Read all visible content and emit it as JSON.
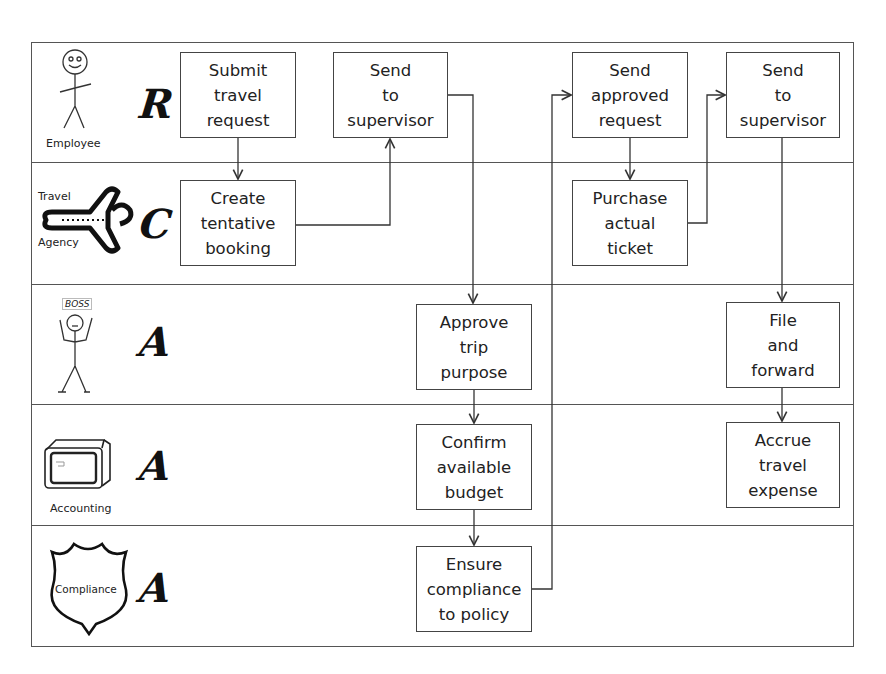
{
  "diagram": {
    "type": "RACI swimlane flowchart",
    "lanes": [
      {
        "actor": "Employee",
        "raci": "R",
        "icon": "stick-figure-icon"
      },
      {
        "actor": "Travel Agency",
        "actor_line1": "Travel",
        "actor_line2": "Agency",
        "raci": "C",
        "icon": "airplane-icon"
      },
      {
        "actor": "Boss",
        "badge": "BOSS",
        "raci": "A",
        "icon": "boss-stick-figure-icon"
      },
      {
        "actor": "Accounting",
        "raci": "A",
        "icon": "computer-monitor-icon"
      },
      {
        "actor": "Compliance",
        "raci": "A",
        "icon": "shield-icon"
      }
    ],
    "steps": {
      "submit": "Submit\ntravel\nrequest",
      "create": "Create\ntentative\nbooking",
      "send1": "Send\nto\nsupervisor",
      "approve": "Approve\ntrip\npurpose",
      "confirm": "Confirm\navailable\nbudget",
      "ensure": "Ensure\ncompliance\nto policy",
      "send_approved": "Send\napproved\nrequest",
      "purchase": "Purchase\nactual\nticket",
      "send2": "Send\nto\nsupervisor",
      "file": "File\nand\nforward",
      "accrue": "Accrue\ntravel\nexpense"
    },
    "flows": [
      [
        "submit",
        "create"
      ],
      [
        "create",
        "send1"
      ],
      [
        "send1",
        "approve"
      ],
      [
        "approve",
        "confirm"
      ],
      [
        "confirm",
        "ensure"
      ],
      [
        "ensure",
        "send_approved"
      ],
      [
        "send_approved",
        "purchase"
      ],
      [
        "purchase",
        "send2"
      ],
      [
        "send2",
        "file"
      ],
      [
        "file",
        "accrue"
      ]
    ]
  }
}
